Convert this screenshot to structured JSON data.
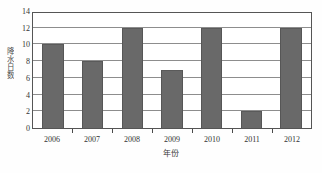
{
  "chart_data": {
    "type": "bar",
    "title": "",
    "subtitle": "",
    "categories": [
      "2006",
      "2007",
      "2008",
      "2009",
      "2010",
      "2011",
      "2012"
    ],
    "values": [
      10,
      8,
      12,
      7,
      12,
      2,
      12
    ],
    "series": [
      {
        "name": "",
        "values": [
          10,
          8,
          12,
          7,
          12,
          2,
          12
        ]
      }
    ],
    "xlabel": "年份",
    "ylabel": "降水日数",
    "ylim": [
      0,
      14
    ],
    "yticks": [
      0,
      2,
      4,
      6,
      8,
      10,
      12,
      14
    ],
    "ytick_labels": [
      "0",
      "2",
      "4",
      "6",
      "8",
      "10",
      "12",
      "14"
    ],
    "grid": "horizontal",
    "legend": "none",
    "bar_color": "#696969",
    "plot_background": "#ffffff",
    "axis_color": "#555555",
    "gridline_color": "#8d8d8d"
  }
}
